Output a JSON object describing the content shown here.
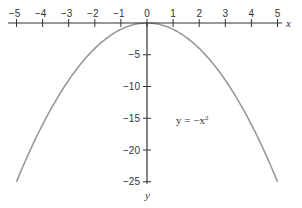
{
  "chart_data": {
    "type": "line",
    "title": "",
    "xlabel": "x",
    "ylabel": "y",
    "xlim": [
      -5,
      5
    ],
    "ylim": [
      -25,
      0
    ],
    "x_ticks": [
      -5,
      -4,
      -3,
      -2,
      -1,
      0,
      1,
      2,
      3,
      4,
      5
    ],
    "x_tick_labels": [
      "−5",
      "−4",
      "−3",
      "−2",
      "−1",
      "0",
      "1",
      "2",
      "3",
      "4",
      "5"
    ],
    "y_ticks": [
      -5,
      -10,
      -15,
      -20,
      -25
    ],
    "y_tick_labels": [
      "−5",
      "−10",
      "−15",
      "−20",
      "−25"
    ],
    "grid": false,
    "annotations": [
      {
        "text": "y = −x²",
        "x": 2.5,
        "y": -17
      }
    ],
    "series": [
      {
        "name": "y = -x^2",
        "color": "#999999",
        "x": [
          -5,
          -4.5,
          -4,
          -3.5,
          -3,
          -2.5,
          -2,
          -1.5,
          -1,
          -0.5,
          0,
          0.5,
          1,
          1.5,
          2,
          2.5,
          3,
          3.5,
          4,
          4.5,
          5
        ],
        "values": [
          -25,
          -20.25,
          -16,
          -12.25,
          -9,
          -6.25,
          -4,
          -2.25,
          -1,
          -0.25,
          0,
          -0.25,
          -1,
          -2.25,
          -4,
          -6.25,
          -9,
          -12.25,
          -16,
          -20.25,
          -25
        ]
      }
    ]
  },
  "labels": {
    "x_axis": "x",
    "y_axis": "y",
    "equation_prefix": "y =  −x",
    "equation_exp": "2"
  }
}
